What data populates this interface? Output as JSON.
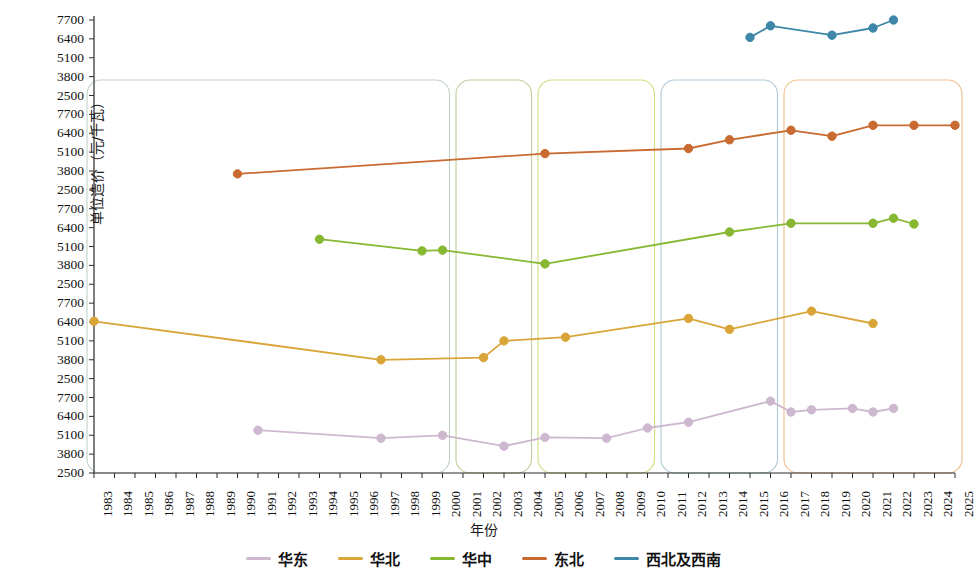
{
  "chart_data": {
    "type": "line",
    "title": "",
    "xlabel": "年份",
    "ylabel": "单位造价（元/千瓦）",
    "grid": false,
    "legend_position": "bottom",
    "panel_count": 5,
    "panel_ylim": [
      2500,
      7700
    ],
    "panel_yticks": [
      2500,
      3800,
      5100,
      6400,
      7700
    ],
    "x": [
      1983,
      1984,
      1985,
      1986,
      1987,
      1988,
      1989,
      1990,
      1991,
      1992,
      1993,
      1994,
      1995,
      1996,
      1997,
      1998,
      1999,
      2000,
      2001,
      2002,
      2003,
      2004,
      2005,
      2006,
      2007,
      2008,
      2009,
      2010,
      2011,
      2012,
      2013,
      2014,
      2015,
      2016,
      2017,
      2018,
      2019,
      2020,
      2021,
      2022,
      2023,
      2024,
      2025
    ],
    "xlim": [
      1983,
      2025
    ],
    "xtick_labels": [
      "1983",
      "1984",
      "1985",
      "1986",
      "1987",
      "1988",
      "1989",
      "1990",
      "1991",
      "1992",
      "1993",
      "1994",
      "1995",
      "1996",
      "1997",
      "1998",
      "1999",
      "2000",
      "2001",
      "2002",
      "2003",
      "2004",
      "2005",
      "2006",
      "2007",
      "2008",
      "2009",
      "2010",
      "2011",
      "2012",
      "2013",
      "2014",
      "2015",
      "2016",
      "2017",
      "2018",
      "2019",
      "2020",
      "2021",
      "2022",
      "2023",
      "2024",
      "2025"
    ],
    "series": [
      {
        "name": "华东",
        "color": "#cdb8cf",
        "panel": 0,
        "points": [
          {
            "x": 1991,
            "y": 5450
          },
          {
            "x": 1997,
            "y": 4900
          },
          {
            "x": 2000,
            "y": 5100
          },
          {
            "x": 2003,
            "y": 4350
          },
          {
            "x": 2005,
            "y": 4950
          },
          {
            "x": 2008,
            "y": 4900
          },
          {
            "x": 2010,
            "y": 5600
          },
          {
            "x": 2012,
            "y": 6000
          },
          {
            "x": 2016,
            "y": 7450
          },
          {
            "x": 2017,
            "y": 6700
          },
          {
            "x": 2018,
            "y": 6850
          },
          {
            "x": 2020,
            "y": 6950
          },
          {
            "x": 2021,
            "y": 6700
          },
          {
            "x": 2022,
            "y": 6950
          }
        ]
      },
      {
        "name": "华北",
        "color": "#d9a538",
        "panel": 1,
        "points": [
          {
            "x": 1983,
            "y": 6450
          },
          {
            "x": 1997,
            "y": 3800
          },
          {
            "x": 2002,
            "y": 3950
          },
          {
            "x": 2003,
            "y": 5100
          },
          {
            "x": 2006,
            "y": 5350
          },
          {
            "x": 2012,
            "y": 6650
          },
          {
            "x": 2014,
            "y": 5900
          },
          {
            "x": 2018,
            "y": 7150
          },
          {
            "x": 2021,
            "y": 6300
          }
        ]
      },
      {
        "name": "华中",
        "color": "#86b832",
        "panel": 2,
        "points": [
          {
            "x": 1994,
            "y": 5600
          },
          {
            "x": 1999,
            "y": 4800
          },
          {
            "x": 2000,
            "y": 4850
          },
          {
            "x": 2005,
            "y": 3900
          },
          {
            "x": 2014,
            "y": 6100
          },
          {
            "x": 2017,
            "y": 6700
          },
          {
            "x": 2021,
            "y": 6700
          },
          {
            "x": 2022,
            "y": 7050
          },
          {
            "x": 2023,
            "y": 6650
          }
        ]
      },
      {
        "name": "东北",
        "color": "#c96a31",
        "panel": 3,
        "points": [
          {
            "x": 1990,
            "y": 3600
          },
          {
            "x": 2005,
            "y": 5000
          },
          {
            "x": 2012,
            "y": 5350
          },
          {
            "x": 2014,
            "y": 5950
          },
          {
            "x": 2017,
            "y": 6600
          },
          {
            "x": 2019,
            "y": 6200
          },
          {
            "x": 2021,
            "y": 6950
          },
          {
            "x": 2023,
            "y": 6950
          },
          {
            "x": 2025,
            "y": 6950
          }
        ]
      },
      {
        "name": "西北及西南",
        "color": "#3e87a8",
        "panel": 4,
        "points": [
          {
            "x": 2015,
            "y": 6500
          },
          {
            "x": 2016,
            "y": 7300
          },
          {
            "x": 2019,
            "y": 6650
          },
          {
            "x": 2021,
            "y": 7150
          },
          {
            "x": 2022,
            "y": 7700
          }
        ]
      }
    ],
    "highlight_boxes": [
      {
        "x0": 1983,
        "x1": 2000,
        "color": "#bfd0c5"
      },
      {
        "x0": 2001,
        "x1": 2004,
        "color": "#b9cc96"
      },
      {
        "x0": 2005,
        "x1": 2010,
        "color": "#ccdb7a"
      },
      {
        "x0": 2011,
        "x1": 2016,
        "color": "#aac6d4"
      },
      {
        "x0": 2017,
        "x1": 2025,
        "color": "#f0bb86"
      }
    ]
  },
  "legend": {
    "items": [
      {
        "label": "华东",
        "color": "#cdb8cf"
      },
      {
        "label": "华北",
        "color": "#d9a538"
      },
      {
        "label": "华中",
        "color": "#86b832"
      },
      {
        "label": "东北",
        "color": "#c96a31"
      },
      {
        "label": "西北及西南",
        "color": "#3e87a8"
      }
    ]
  },
  "axes": {
    "x_title": "年份",
    "y_title": "单位造价（元/千瓦）"
  }
}
